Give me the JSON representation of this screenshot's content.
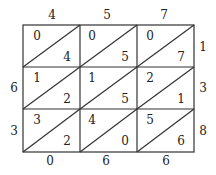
{
  "top_digits": [
    "4",
    "5",
    "7"
  ],
  "right_digits": [
    "1",
    "3",
    "8"
  ],
  "left_digits": [
    "6",
    "3"
  ],
  "bottom_digits": [
    "0",
    "6",
    "6"
  ],
  "cells": [
    [
      {
        "tl": "0",
        "br": "4"
      },
      {
        "tl": "0",
        "br": "5"
      },
      {
        "tl": "0",
        "br": "7"
      }
    ],
    [
      {
        "tl": "1",
        "br": "2"
      },
      {
        "tl": "1",
        "br": "5"
      },
      {
        "tl": "2",
        "br": "1"
      }
    ],
    [
      {
        "tl": "3",
        "br": "2"
      },
      {
        "tl": "4",
        "br": "0"
      },
      {
        "tl": "5",
        "br": "6"
      }
    ]
  ]
}
